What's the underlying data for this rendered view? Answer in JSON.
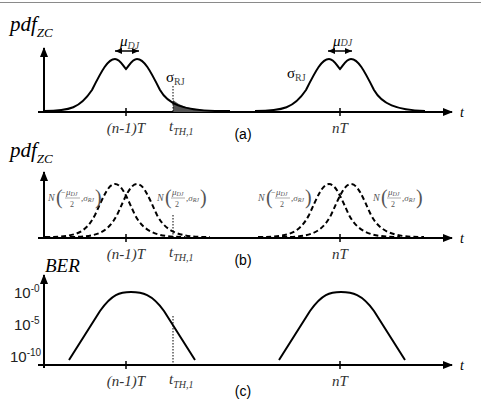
{
  "figure": {
    "panels": [
      {
        "id": "a",
        "caption": "(a)",
        "ylabel": "pdf",
        "ylabel_sub": "ZC",
        "xlabel": "t",
        "ticks": [
          {
            "label": "(n-1)T",
            "x": 126
          },
          {
            "label": "nT",
            "x": 340
          }
        ],
        "threshold": {
          "label": "t",
          "sub": "TH,1",
          "x": 173
        },
        "annotations": {
          "mu_left": "μ",
          "mu_sub": "DJ",
          "sigma_left": "σ",
          "sigma_sub": "RJ",
          "mu_right": "μ",
          "sigma_right": "σ"
        },
        "description": "Dual-Dirac total jitter PDF around each zero crossing; shaded tail beyond threshold t_TH,1"
      },
      {
        "id": "b",
        "caption": "(b)",
        "ylabel": "pdf",
        "ylabel_sub": "ZC",
        "xlabel": "t",
        "ticks": [
          {
            "label": "(n-1)T",
            "x": 126
          },
          {
            "label": "nT",
            "x": 340
          }
        ],
        "threshold": {
          "label": "t",
          "sub": "TH,1",
          "x": 173
        },
        "gaussians": {
          "left": {
            "N": "N",
            "mu": "μ",
            "mu_sub": "DJ",
            "den": "2",
            "sign": "−",
            "sigma": "σ",
            "sigma_sub": "RJ"
          },
          "right": {
            "N": "N",
            "mu": "μ",
            "mu_sub": "DJ",
            "den": "2",
            "sign": "",
            "sigma": "σ",
            "sigma_sub": "RJ"
          }
        },
        "description": "Decomposition into two dashed Gaussians N(±μDJ/2, σRJ)"
      },
      {
        "id": "c",
        "caption": "(c)",
        "ylabel": "BER",
        "xlabel": "t",
        "yticks": [
          {
            "base": "10",
            "exp": "-0"
          },
          {
            "base": "10",
            "exp": "-5"
          },
          {
            "base": "10",
            "exp": "-10"
          }
        ],
        "ticks": [
          {
            "label": "(n-1)T",
            "x": 126
          },
          {
            "label": "nT",
            "x": 340
          }
        ],
        "threshold": {
          "label": "t",
          "sub": "TH,1",
          "x": 173
        },
        "description": "Bathtub-type BER curve (log scale) around each crossing"
      }
    ]
  }
}
